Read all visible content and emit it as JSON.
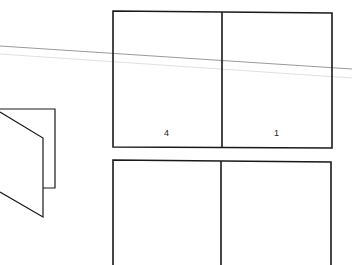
{
  "diagram": {
    "type": "folding-sheet-imposition",
    "colors": {
      "stroke": "#1a1a1a",
      "guide_line": "#9a9a9a",
      "guide_line_faint": "#dddddd",
      "background": "#ffffff"
    },
    "top_sheet": {
      "panels": [
        {
          "id": "panel-left",
          "label": "4"
        },
        {
          "id": "panel-right",
          "label": "1"
        }
      ]
    },
    "bottom_sheet": {
      "panels": [
        {
          "id": "panel-left",
          "label": ""
        },
        {
          "id": "panel-right",
          "label": ""
        }
      ]
    },
    "folded_card_icon": "folded-leaflet"
  }
}
